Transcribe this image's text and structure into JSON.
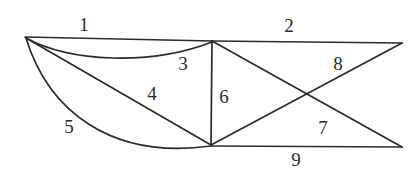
{
  "figure": {
    "type": "graph-diagram",
    "width": 418,
    "height": 179,
    "background_color": "#ffffff",
    "stroke_color": "#2b2b2b",
    "label_color": "#2b2b2b"
  },
  "vertices": [
    {
      "id": "A",
      "name": "left-vertex",
      "x": 25,
      "y": 37
    },
    {
      "id": "B",
      "name": "top-middle-vertex",
      "x": 212,
      "y": 41
    },
    {
      "id": "C",
      "name": "top-right-vertex",
      "x": 402,
      "y": 43
    },
    {
      "id": "D",
      "name": "bottom-middle-vertex",
      "x": 211,
      "y": 145
    },
    {
      "id": "E",
      "name": "bottom-right-vertex",
      "x": 402,
      "y": 147
    }
  ],
  "edges": [
    {
      "label": "1",
      "name": "edge-1",
      "from": "A",
      "to": "B",
      "shape": "straight",
      "d": "M 25 37 L 212 41"
    },
    {
      "label": "2",
      "name": "edge-2",
      "from": "B",
      "to": "C",
      "shape": "straight",
      "d": "M 212 41 L 402 43"
    },
    {
      "label": "3",
      "name": "edge-3",
      "from": "A",
      "to": "B",
      "shape": "curved",
      "d": "M 26 38 C 70 62, 150 66, 212 42"
    },
    {
      "label": "4",
      "name": "edge-4",
      "from": "A",
      "to": "D",
      "shape": "straight",
      "d": "M 26 38 L 211 145"
    },
    {
      "label": "5",
      "name": "edge-5",
      "from": "A",
      "to": "D",
      "shape": "curved",
      "d": "M 26 38 C 48 110, 110 160, 211 146"
    },
    {
      "label": "6",
      "name": "edge-6",
      "from": "B",
      "to": "D",
      "shape": "straight",
      "d": "M 212 41 L 211 145"
    },
    {
      "label": "7",
      "name": "edge-7",
      "from": "D",
      "to": "C",
      "shape": "straight",
      "d": "M 211 145 L 402 43"
    },
    {
      "label": "8",
      "name": "edge-8",
      "from": "B",
      "to": "E",
      "shape": "straight",
      "d": "M 212 41 L 402 147"
    },
    {
      "label": "9",
      "name": "edge-9",
      "from": "D",
      "to": "E",
      "shape": "straight",
      "d": "M 211 146 L 402 147"
    }
  ],
  "edge_labels": [
    {
      "text": "1",
      "name": "edge-label-1",
      "x": 84,
      "y": 24
    },
    {
      "text": "2",
      "name": "edge-label-2",
      "x": 289,
      "y": 25
    },
    {
      "text": "3",
      "name": "edge-label-3",
      "x": 183,
      "y": 63
    },
    {
      "text": "4",
      "name": "edge-label-4",
      "x": 152,
      "y": 93
    },
    {
      "text": "5",
      "name": "edge-label-5",
      "x": 69,
      "y": 126
    },
    {
      "text": "6",
      "name": "edge-label-6",
      "x": 224,
      "y": 96
    },
    {
      "text": "7",
      "name": "edge-label-7",
      "x": 323,
      "y": 127
    },
    {
      "text": "8",
      "name": "edge-label-8",
      "x": 338,
      "y": 63
    },
    {
      "text": "9",
      "name": "edge-label-9",
      "x": 296,
      "y": 159
    }
  ]
}
